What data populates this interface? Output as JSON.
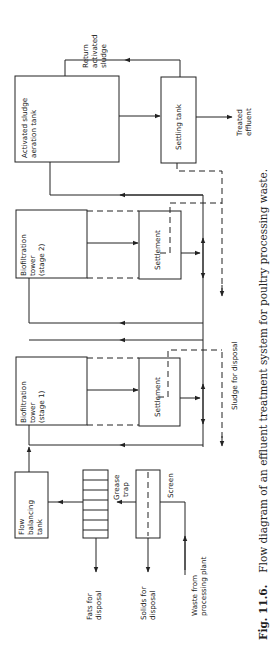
{
  "figure": {
    "number": "Fig. 11.6.",
    "caption": "Flow diagram of an effluent treatment system for poultry processing waste.",
    "orientation": "rotated 90 degrees counter-clockwise"
  },
  "units": {
    "aeration_tank": {
      "line1": "Activated sludge",
      "line2": "aeration tank"
    },
    "settling_tank": {
      "label": "Settling tank"
    },
    "biofilter2": {
      "line1": "Biofiltration",
      "line2": "tower",
      "line3": "(stage 2)"
    },
    "settlement2": {
      "label": "Settlement"
    },
    "biofilter1": {
      "line1": "Biofiltration",
      "line2": "tower",
      "line3": "(stage 1)"
    },
    "settlement1": {
      "label": "Settlement"
    },
    "flow_balancing": {
      "line1": "Flow",
      "line2": "balancing",
      "line3": "tank"
    },
    "grease_trap": {
      "line1": "Grease",
      "line2": "trap"
    },
    "screen": {
      "label": "Screen"
    }
  },
  "flows": {
    "return_sludge": {
      "line1": "Return",
      "line2": "activated",
      "line3": "sludge"
    },
    "treated_effluent": {
      "line1": "Treated",
      "line2": "effluent"
    },
    "sludge_disposal": {
      "label": "Sludge for disposal"
    },
    "fats_disposal": {
      "line1": "Fats for",
      "line2": "disposal"
    },
    "solids_disposal": {
      "line1": "Solids for",
      "line2": "disposal"
    },
    "waste_input": {
      "line1": "Waste from",
      "line2": "processing plant"
    }
  }
}
